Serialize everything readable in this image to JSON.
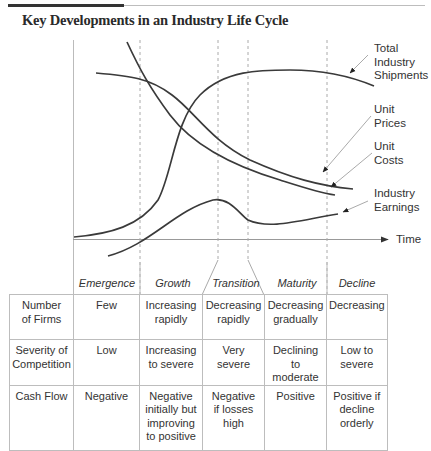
{
  "title": "Key Developments in an Industry Life Cycle",
  "chart_labels": {
    "total_industry_shipments": "Total Industry Shipments",
    "unit_prices": "Unit Prices",
    "unit_costs": "Unit Costs",
    "industry_earnings": "Industry Earnings",
    "x_axis": "Time"
  },
  "curves": [
    {
      "name": "Total Industry Shipments",
      "shape": "S-curve rising, plateau and slight decline in Decline phase"
    },
    {
      "name": "Unit Prices",
      "shape": "steep decline from Emergence, flattening"
    },
    {
      "name": "Unit Costs",
      "shape": "gentle decline then steady decrease"
    },
    {
      "name": "Industry Earnings",
      "shape": "rise to peak at Transition start, dip, then slow rise"
    }
  ],
  "phases": [
    "Emergence",
    "Growth",
    "Transition",
    "Maturity",
    "Decline"
  ],
  "table": {
    "rows": [
      {
        "label": "Number of Firms",
        "label_lines": [
          "Number",
          "of Firms"
        ],
        "values": [
          [
            "Few"
          ],
          [
            "Increasing",
            "rapidly"
          ],
          [
            "Decreasing",
            "rapidly"
          ],
          [
            "Decreasing",
            "gradually"
          ],
          [
            "Decreasing"
          ]
        ]
      },
      {
        "label": "Severity of Competition",
        "label_lines": [
          "Severity of",
          "Competition"
        ],
        "values": [
          [
            "Low"
          ],
          [
            "Increasing",
            "to severe"
          ],
          [
            "Very severe"
          ],
          [
            "Declining to",
            "moderate"
          ],
          [
            "Low to",
            "severe"
          ]
        ]
      },
      {
        "label": "Cash Flow",
        "label_lines": [
          "Cash Flow"
        ],
        "values": [
          [
            "Negative"
          ],
          [
            "Negative",
            "initially but",
            "improving",
            "to positive"
          ],
          [
            "Negative",
            "if losses",
            "high"
          ],
          [
            "Positive"
          ],
          [
            "Positive if",
            "decline",
            "orderly"
          ]
        ]
      }
    ]
  }
}
